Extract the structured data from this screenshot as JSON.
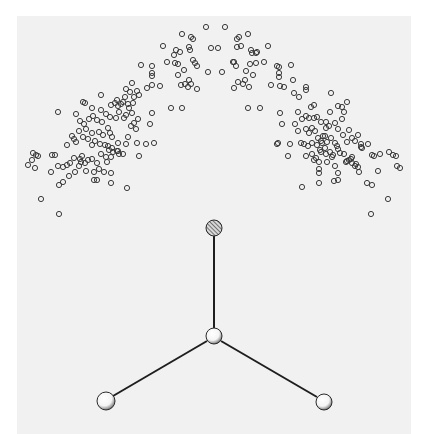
{
  "figure": {
    "background": "#ffffff",
    "panel_background": "#f1f1f1",
    "dot_stroke": "#3a3a3a",
    "dot_radius": 2.6,
    "line_color": "#1e1e1e"
  },
  "scatter": {
    "description": "scatter of small open circles arranged in a wide arch, with dense clusters on left and right shoulders",
    "points": [
      [
        206,
        27
      ],
      [
        225,
        27
      ],
      [
        182,
        34
      ],
      [
        191,
        37
      ],
      [
        193,
        39
      ],
      [
        239,
        37
      ],
      [
        248,
        34
      ],
      [
        237,
        39
      ],
      [
        163,
        46
      ],
      [
        211,
        48
      ],
      [
        218,
        48
      ],
      [
        189,
        47
      ],
      [
        174,
        55
      ],
      [
        180,
        52
      ],
      [
        176,
        50
      ],
      [
        190,
        50
      ],
      [
        193,
        60
      ],
      [
        237,
        47
      ],
      [
        241,
        46
      ],
      [
        251,
        50
      ],
      [
        256,
        53
      ],
      [
        268,
        46
      ],
      [
        252,
        53
      ],
      [
        257,
        52
      ],
      [
        167,
        62
      ],
      [
        175,
        63
      ],
      [
        178,
        64
      ],
      [
        184,
        70
      ],
      [
        195,
        63
      ],
      [
        197,
        66
      ],
      [
        208,
        72
      ],
      [
        222,
        72
      ],
      [
        233,
        62
      ],
      [
        236,
        66
      ],
      [
        234,
        62
      ],
      [
        246,
        71
      ],
      [
        250,
        64
      ],
      [
        256,
        63
      ],
      [
        264,
        62
      ],
      [
        277,
        66
      ],
      [
        291,
        65
      ],
      [
        141,
        65
      ],
      [
        152,
        66
      ],
      [
        152,
        73
      ],
      [
        152,
        76
      ],
      [
        178,
        75
      ],
      [
        189,
        80
      ],
      [
        185,
        84
      ],
      [
        191,
        84
      ],
      [
        181,
        85
      ],
      [
        188,
        87
      ],
      [
        197,
        89
      ],
      [
        234,
        88
      ],
      [
        238,
        82
      ],
      [
        243,
        84
      ],
      [
        245,
        80
      ],
      [
        249,
        87
      ],
      [
        253,
        75
      ],
      [
        147,
        88
      ],
      [
        152,
        85
      ],
      [
        160,
        86
      ],
      [
        126,
        89
      ],
      [
        132,
        83
      ],
      [
        137,
        91
      ],
      [
        139,
        95
      ],
      [
        134,
        97
      ],
      [
        101,
        95
      ],
      [
        171,
        108
      ],
      [
        182,
        108
      ],
      [
        248,
        108
      ],
      [
        260,
        108
      ],
      [
        271,
        85
      ],
      [
        280,
        86
      ],
      [
        284,
        87
      ],
      [
        279,
        73
      ],
      [
        279,
        77
      ],
      [
        279,
        67
      ],
      [
        293,
        80
      ],
      [
        306,
        87
      ],
      [
        294,
        93
      ],
      [
        299,
        97
      ],
      [
        306,
        90
      ],
      [
        331,
        93
      ],
      [
        280,
        113
      ],
      [
        282,
        124
      ],
      [
        290,
        144
      ],
      [
        288,
        156
      ],
      [
        278,
        143
      ],
      [
        277,
        144
      ],
      [
        58,
        112
      ],
      [
        76,
        114
      ],
      [
        85,
        103
      ],
      [
        83,
        102
      ],
      [
        92,
        108
      ],
      [
        101,
        110
      ],
      [
        111,
        105
      ],
      [
        110,
        117
      ],
      [
        117,
        100
      ],
      [
        115,
        103
      ],
      [
        118,
        106
      ],
      [
        121,
        104
      ],
      [
        123,
        102
      ],
      [
        125,
        97
      ],
      [
        130,
        92
      ],
      [
        80,
        121
      ],
      [
        89,
        119
      ],
      [
        93,
        116
      ],
      [
        97,
        120
      ],
      [
        102,
        122
      ],
      [
        106,
        114
      ],
      [
        108,
        128
      ],
      [
        116,
        118
      ],
      [
        119,
        112
      ],
      [
        124,
        118
      ],
      [
        126,
        115
      ],
      [
        132,
        113
      ],
      [
        133,
        103
      ],
      [
        128,
        104
      ],
      [
        129,
        108
      ],
      [
        84,
        124
      ],
      [
        86,
        129
      ],
      [
        92,
        133
      ],
      [
        99,
        132
      ],
      [
        103,
        135
      ],
      [
        110,
        133
      ],
      [
        112,
        137
      ],
      [
        118,
        143
      ],
      [
        128,
        137
      ],
      [
        131,
        126
      ],
      [
        136,
        129
      ],
      [
        138,
        119
      ],
      [
        134,
        123
      ],
      [
        152,
        113
      ],
      [
        150,
        124
      ],
      [
        72,
        136
      ],
      [
        74,
        139
      ],
      [
        67,
        145
      ],
      [
        76,
        142
      ],
      [
        79,
        131
      ],
      [
        83,
        137
      ],
      [
        88,
        139
      ],
      [
        92,
        145
      ],
      [
        95,
        141
      ],
      [
        100,
        144
      ],
      [
        105,
        145
      ],
      [
        108,
        146
      ],
      [
        112,
        148
      ],
      [
        117,
        151
      ],
      [
        119,
        154
      ],
      [
        123,
        154
      ],
      [
        80,
        159
      ],
      [
        82,
        156
      ],
      [
        88,
        160
      ],
      [
        92,
        159
      ],
      [
        97,
        163
      ],
      [
        101,
        154
      ],
      [
        106,
        157
      ],
      [
        109,
        150
      ],
      [
        113,
        152
      ],
      [
        118,
        151
      ],
      [
        126,
        144
      ],
      [
        137,
        143
      ],
      [
        139,
        156
      ],
      [
        146,
        144
      ],
      [
        154,
        143
      ],
      [
        36,
        155
      ],
      [
        38,
        156
      ],
      [
        33,
        153
      ],
      [
        52,
        155
      ],
      [
        55,
        155
      ],
      [
        28,
        165
      ],
      [
        32,
        160
      ],
      [
        35,
        168
      ],
      [
        51,
        172
      ],
      [
        58,
        166
      ],
      [
        63,
        167
      ],
      [
        67,
        165
      ],
      [
        70,
        163
      ],
      [
        74,
        158
      ],
      [
        69,
        176
      ],
      [
        75,
        172
      ],
      [
        79,
        166
      ],
      [
        81,
        162
      ],
      [
        85,
        163
      ],
      [
        86,
        171
      ],
      [
        94,
        172
      ],
      [
        99,
        169
      ],
      [
        104,
        172
      ],
      [
        107,
        162
      ],
      [
        111,
        157
      ],
      [
        94,
        180
      ],
      [
        97,
        180
      ],
      [
        111,
        173
      ],
      [
        111,
        183
      ],
      [
        127,
        188
      ],
      [
        59,
        185
      ],
      [
        63,
        182
      ],
      [
        41,
        199
      ],
      [
        59,
        214
      ],
      [
        298,
        112
      ],
      [
        306,
        116
      ],
      [
        309,
        118
      ],
      [
        311,
        107
      ],
      [
        314,
        105
      ],
      [
        314,
        118
      ],
      [
        317,
        117
      ],
      [
        321,
        122
      ],
      [
        326,
        122
      ],
      [
        330,
        112
      ],
      [
        344,
        112
      ],
      [
        347,
        102
      ],
      [
        338,
        106
      ],
      [
        342,
        107
      ],
      [
        295,
        124
      ],
      [
        302,
        119
      ],
      [
        306,
        129
      ],
      [
        298,
        131
      ],
      [
        309,
        133
      ],
      [
        312,
        128
      ],
      [
        315,
        131
      ],
      [
        318,
        138
      ],
      [
        321,
        141
      ],
      [
        323,
        136
      ],
      [
        325,
        136
      ],
      [
        326,
        128
      ],
      [
        329,
        126
      ],
      [
        335,
        123
      ],
      [
        338,
        129
      ],
      [
        342,
        119
      ],
      [
        301,
        143
      ],
      [
        304,
        144
      ],
      [
        308,
        146
      ],
      [
        312,
        143
      ],
      [
        317,
        145
      ],
      [
        320,
        150
      ],
      [
        322,
        143
      ],
      [
        325,
        148
      ],
      [
        327,
        142
      ],
      [
        331,
        138
      ],
      [
        335,
        143
      ],
      [
        338,
        149
      ],
      [
        343,
        135
      ],
      [
        347,
        142
      ],
      [
        349,
        130
      ],
      [
        352,
        138
      ],
      [
        306,
        156
      ],
      [
        312,
        154
      ],
      [
        316,
        158
      ],
      [
        319,
        162
      ],
      [
        321,
        152
      ],
      [
        326,
        154
      ],
      [
        330,
        152
      ],
      [
        333,
        155
      ],
      [
        337,
        146
      ],
      [
        340,
        153
      ],
      [
        344,
        154
      ],
      [
        347,
        161
      ],
      [
        352,
        157
      ],
      [
        355,
        141
      ],
      [
        358,
        135
      ],
      [
        361,
        144
      ],
      [
        314,
        160
      ],
      [
        319,
        169
      ],
      [
        327,
        162
      ],
      [
        332,
        157
      ],
      [
        335,
        166
      ],
      [
        338,
        173
      ],
      [
        346,
        162
      ],
      [
        349,
        160
      ],
      [
        352,
        163
      ],
      [
        355,
        166
      ],
      [
        361,
        147
      ],
      [
        362,
        148
      ],
      [
        368,
        144
      ],
      [
        372,
        155
      ],
      [
        374,
        156
      ],
      [
        380,
        154
      ],
      [
        302,
        187
      ],
      [
        319,
        173
      ],
      [
        319,
        183
      ],
      [
        334,
        181
      ],
      [
        338,
        180
      ],
      [
        351,
        159
      ],
      [
        356,
        164
      ],
      [
        358,
        167
      ],
      [
        359,
        172
      ],
      [
        367,
        183
      ],
      [
        372,
        185
      ],
      [
        378,
        171
      ],
      [
        389,
        152
      ],
      [
        393,
        155
      ],
      [
        396,
        156
      ],
      [
        397,
        166
      ],
      [
        400,
        168
      ],
      [
        388,
        199
      ],
      [
        371,
        214
      ]
    ]
  },
  "molecule": {
    "description": "trigonal structure: hatched atom on top bonded to a central atom, which bonds to two lower atoms",
    "atoms": [
      {
        "name": "top-atom",
        "x": 214,
        "y": 228,
        "r": 8,
        "fill": "hatched"
      },
      {
        "name": "center-atom",
        "x": 214,
        "y": 336,
        "r": 8,
        "fill": "shaded"
      },
      {
        "name": "left-atom",
        "x": 106,
        "y": 401,
        "r": 9,
        "fill": "shaded"
      },
      {
        "name": "right-atom",
        "x": 324,
        "y": 402,
        "r": 8,
        "fill": "shaded"
      }
    ],
    "bonds": [
      {
        "from": [
          214,
          236
        ],
        "to": [
          214,
          328
        ]
      },
      {
        "from": [
          207,
          341
        ],
        "to": [
          113,
          396
        ]
      },
      {
        "from": [
          221,
          341
        ],
        "to": [
          317,
          397
        ]
      }
    ]
  }
}
